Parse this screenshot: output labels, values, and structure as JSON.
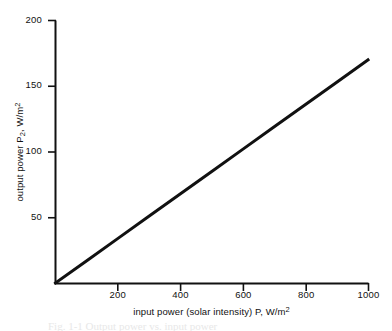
{
  "chart_data": {
    "type": "line",
    "title": "",
    "subtitle": "",
    "xlabel_parts": {
      "text": "input power (solar intensity) P, W/m",
      "superscript": "2"
    },
    "ylabel_parts": {
      "pre": "output power P",
      "subscript": "2",
      "post": ", W/m",
      "superscript": "2"
    },
    "xlabel": "input power (solar intensity) P, W/m2",
    "ylabel": "output power P2, W/m2",
    "xlim": [
      0,
      1000
    ],
    "ylim": [
      0,
      200
    ],
    "xticks": [
      200,
      400,
      600,
      800,
      1000
    ],
    "yticks": [
      50,
      100,
      150,
      200
    ],
    "xtick_labels": [
      "200",
      "400",
      "600",
      "800",
      "1000"
    ],
    "ytick_labels": [
      "50",
      "100",
      "150",
      "200"
    ],
    "grid": false,
    "legend": null,
    "legend_position": "none",
    "spines": [
      "left",
      "bottom"
    ],
    "tick_direction": "out",
    "series": [
      {
        "name": "output power vs input power",
        "color": "#111111",
        "line_width": 3,
        "x": [
          0,
          100,
          200,
          300,
          400,
          500,
          600,
          700,
          800,
          900,
          1000
        ],
        "y": [
          0,
          17,
          34,
          51,
          68,
          85,
          102,
          119,
          136,
          153,
          170
        ]
      }
    ],
    "annotations": [],
    "caption_fragment": "Fig. 1-1  Output power vs. input power"
  },
  "axes": {
    "x_title": "input power (solar intensity) P, W/m",
    "y_title": "output power P"
  },
  "colors": {
    "background": "#ffffff",
    "axis": "#111111",
    "data_line": "#111111",
    "text": "#111111"
  }
}
